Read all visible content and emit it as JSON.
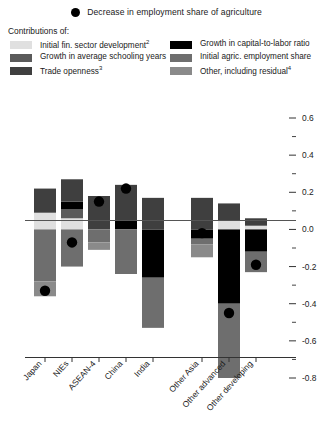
{
  "marker_legend": {
    "icon": "filled-circle-marker",
    "label": "Decrease in employment share of agriculture"
  },
  "legend": {
    "title": "Contributions of:",
    "items": [
      {
        "label": "Initial fin. sector development",
        "sup": "2",
        "color": "#e0e0e0",
        "column": "left"
      },
      {
        "label": "Growth in capital-to-labor ratio",
        "sup": "",
        "color": "#000000",
        "column": "right"
      },
      {
        "label": "Growth in average schooling years",
        "sup": "",
        "color": "#5a5a5a",
        "column": "left"
      },
      {
        "label": "Initial agric. employment share",
        "sup": "",
        "color": "#6e6e6e",
        "column": "right"
      },
      {
        "label": "Trade openness",
        "sup": "3",
        "color": "#3f3f3f",
        "column": "left"
      },
      {
        "label": "Other, including residual",
        "sup": "4",
        "color": "#8a8a8a",
        "column": "right"
      }
    ]
  },
  "chart_data": {
    "type": "bar",
    "title": "",
    "subtitle": "",
    "xlabel": "",
    "ylabel": "",
    "grid": false,
    "legend_position": "top",
    "stacked": true,
    "ylim": [
      -0.8,
      0.6
    ],
    "ytick_major": [
      0.6,
      0.4,
      0.2,
      0.0,
      -0.2,
      -0.4,
      -0.6,
      -0.8
    ],
    "ytick_major_labels": [
      "0.6",
      "0.4",
      "0.2",
      "0.0",
      "-0.2",
      "-0.4",
      "-0.6",
      "-0.8"
    ],
    "ytick_minor": [
      0.5,
      0.3,
      0.1,
      -0.1,
      -0.3,
      -0.5,
      -0.7
    ],
    "categories": [
      "Japan",
      "NIEs",
      "ASEAN-4",
      "China",
      "India",
      "Other Asia",
      "Other advanced",
      "Other developing"
    ],
    "category_gap_after": 5,
    "series": [
      {
        "name": "Initial fin. sector development",
        "color": "#e0e0e0",
        "values": [
          0.09,
          0.06,
          0.0,
          0.0,
          0.0,
          0.0,
          0.05,
          0.02
        ]
      },
      {
        "name": "Growth in average schooling years",
        "color": "#5a5a5a",
        "values": [
          0.0,
          0.05,
          0.0,
          0.0,
          0.0,
          0.0,
          0.0,
          0.0
        ]
      },
      {
        "name": "Growth in capital-to-labor ratio",
        "color": "#000000",
        "values": [
          0.0,
          0.04,
          0.0,
          0.05,
          -0.26,
          -0.05,
          -0.4,
          -0.12
        ]
      },
      {
        "name": "Trade openness",
        "color": "#3f3f3f",
        "values": [
          0.13,
          0.12,
          0.18,
          0.19,
          0.17,
          0.17,
          0.09,
          0.04
        ]
      },
      {
        "name": "Initial agric. employment share",
        "color": "#6e6e6e",
        "values": [
          -0.28,
          -0.2,
          -0.07,
          -0.24,
          -0.27,
          -0.03,
          -0.4,
          -0.11
        ]
      },
      {
        "name": "Other, including residual",
        "color": "#8a8a8a",
        "values": [
          -0.08,
          0.0,
          -0.04,
          0.0,
          0.0,
          -0.07,
          0.0,
          0.0
        ]
      }
    ],
    "markers": {
      "name": "Decrease in employment share of agriculture",
      "color": "#000000",
      "values": [
        -0.33,
        -0.07,
        0.15,
        0.22,
        -0.2,
        -0.02,
        -0.45,
        -0.19
      ]
    }
  }
}
